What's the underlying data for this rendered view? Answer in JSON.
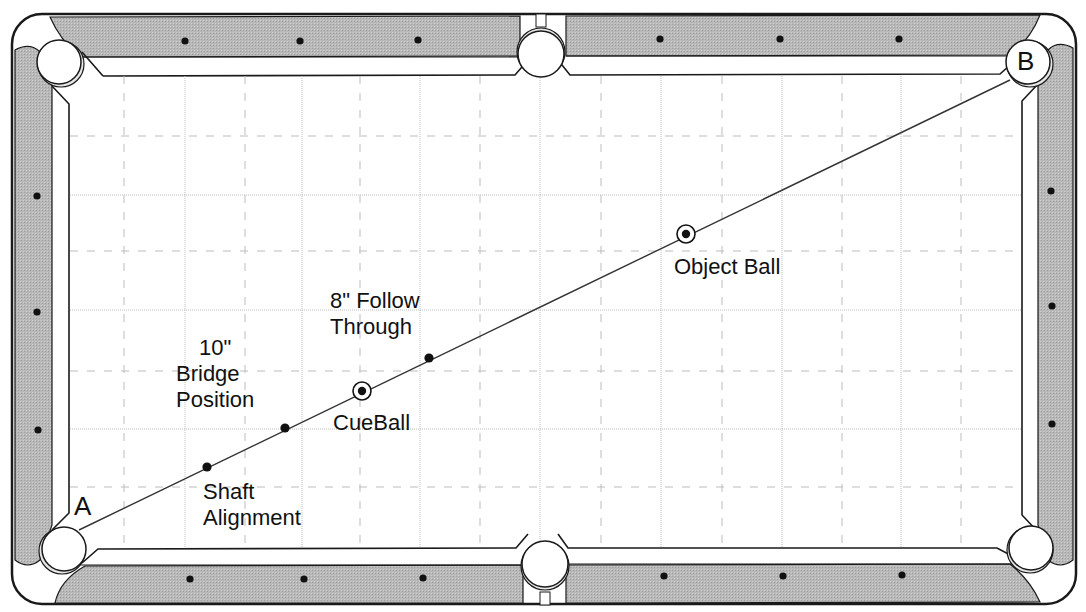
{
  "diagram": {
    "colors": {
      "rail": "#b4b4b4",
      "rail_stroke": "#1a1a1a",
      "cushion": "#ffffff",
      "grid_line": "#bdbdbd",
      "line": "#333333",
      "dot": "#111111",
      "text": "#111111"
    },
    "corners": {
      "A": {
        "label": "A",
        "x": 86,
        "y": 507
      },
      "B": {
        "label": "B",
        "x": 1028,
        "y": 62
      }
    },
    "aim_line": {
      "x1": 79,
      "y1": 530,
      "x2": 1010,
      "y2": 80
    },
    "points": [
      {
        "id": "shaft",
        "x": 207,
        "y": 467,
        "kind": "dot"
      },
      {
        "id": "bridge",
        "x": 285,
        "y": 428,
        "kind": "dot"
      },
      {
        "id": "cueball",
        "x": 362,
        "y": 391,
        "kind": "ball"
      },
      {
        "id": "follow",
        "x": 429,
        "y": 358,
        "kind": "dot"
      },
      {
        "id": "object",
        "x": 686,
        "y": 234,
        "kind": "ball"
      }
    ],
    "labels": {
      "shaft": [
        "Shaft",
        "Alignment"
      ],
      "bridge": [
        "10\"",
        "Bridge",
        "Position"
      ],
      "cueball": [
        "CueBall"
      ],
      "follow": [
        "8\" Follow",
        "Through"
      ],
      "object": [
        "Object Ball"
      ]
    },
    "diamonds": {
      "top": [
        [
          185,
          41
        ],
        [
          300,
          41
        ],
        [
          418,
          40
        ],
        [
          660,
          39
        ],
        [
          780,
          39
        ],
        [
          899,
          39
        ]
      ],
      "bottom": [
        [
          190,
          579
        ],
        [
          304,
          579
        ],
        [
          423,
          578
        ],
        [
          664,
          576
        ],
        [
          783,
          576
        ],
        [
          902,
          575
        ]
      ],
      "left": [
        [
          37,
          196
        ],
        [
          37,
          312
        ],
        [
          38,
          430
        ]
      ],
      "right": [
        [
          1051,
          191
        ],
        [
          1052,
          306
        ],
        [
          1052,
          424
        ]
      ]
    },
    "grid": {
      "dotted_x": [
        185,
        302,
        420,
        540,
        661,
        782,
        901
      ],
      "dashed_x": [
        124,
        245,
        360,
        480,
        601,
        722,
        842,
        961
      ],
      "dotted_y": [
        195,
        310,
        429
      ],
      "dashed_y": [
        136,
        251,
        371,
        487
      ]
    }
  }
}
